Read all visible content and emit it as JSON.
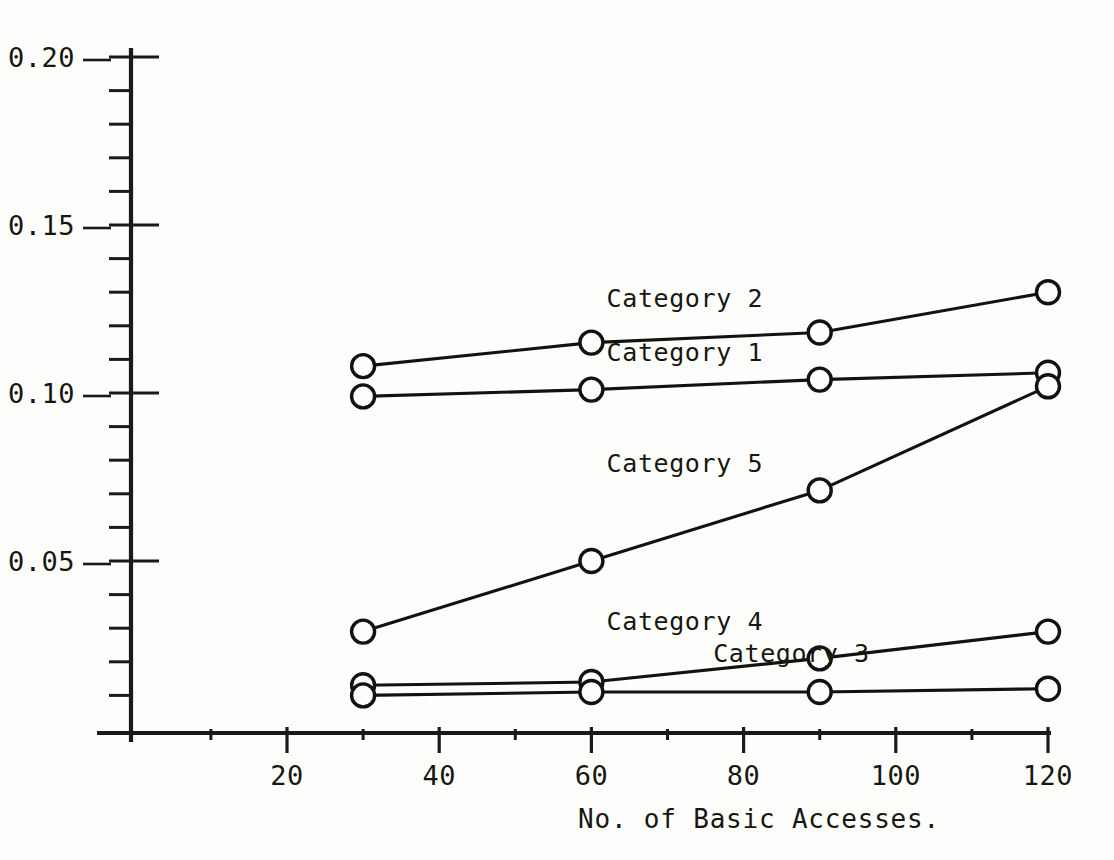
{
  "chart_data": {
    "type": "line",
    "title": "",
    "xlabel": "No. of Basic Accesses.",
    "ylabel": "",
    "x": [
      30,
      60,
      90,
      120
    ],
    "xlim": [
      0,
      124
    ],
    "ylim": [
      0,
      0.2
    ],
    "grid": false,
    "legend_position": "inline-right-of-series",
    "x_ticks_major": [
      20,
      40,
      60,
      80,
      100,
      120
    ],
    "x_tick_labels": [
      "20",
      "40",
      "60",
      "80",
      "100",
      "120"
    ],
    "x_ticks_minor": [
      10,
      30,
      50,
      70,
      90,
      110
    ],
    "y_ticks_major": [
      0.05,
      0.1,
      0.15,
      0.2
    ],
    "y_tick_labels": [
      "0.05",
      "0.10",
      "0.15",
      "0.20"
    ],
    "y_ticks_minor": [
      0.01,
      0.02,
      0.03,
      0.04,
      0.06,
      0.07,
      0.08,
      0.09,
      0.11,
      0.12,
      0.13,
      0.14,
      0.16,
      0.17,
      0.18,
      0.19
    ],
    "marker": "open-circle",
    "series": [
      {
        "name": "Category 2",
        "label": "Category 2",
        "values": [
          0.108,
          0.115,
          0.118,
          0.13
        ],
        "label_x": 62,
        "label_y": 0.1255
      },
      {
        "name": "Category 1",
        "label": "Category 1",
        "values": [
          0.099,
          0.101,
          0.104,
          0.106
        ],
        "label_x": 62,
        "label_y": 0.1095
      },
      {
        "name": "Category 5",
        "label": "Category 5",
        "values": [
          0.029,
          0.05,
          0.071,
          0.102
        ],
        "label_x": 62,
        "label_y": 0.0765
      },
      {
        "name": "Category 4",
        "label": "Category 4",
        "values": [
          0.013,
          0.014,
          0.021,
          0.029
        ],
        "label_x": 62,
        "label_y": 0.0295
      },
      {
        "name": "Category 3",
        "label": "Category 3",
        "values": [
          0.01,
          0.011,
          0.011,
          0.012
        ],
        "label_x": 76,
        "label_y": 0.02
      }
    ],
    "colors": {
      "ink": "#121210",
      "background": "#fdfdfc",
      "marker_fill": "#fdfdfc"
    }
  }
}
